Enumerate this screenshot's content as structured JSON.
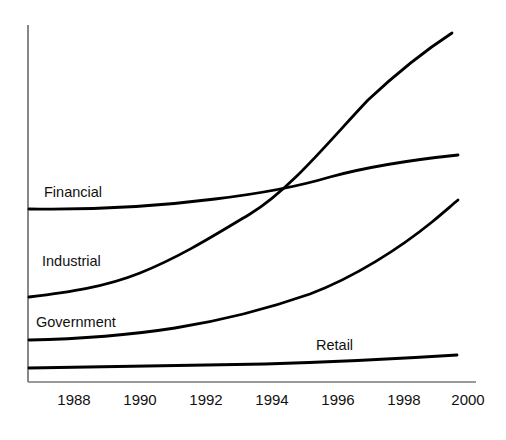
{
  "chart_data": {
    "type": "line",
    "title": "",
    "xlabel": "",
    "ylabel": "",
    "grid": false,
    "legend_position": "inline-labels",
    "axis": {
      "x_ticks": [
        "1988",
        "1990",
        "1992",
        "1994",
        "1996",
        "1998",
        "2000"
      ],
      "x_range": [
        1987,
        2000.5
      ],
      "y_ticks": [],
      "y_range": [
        0,
        100
      ],
      "axis_color": "#555555",
      "line_color": "#000000"
    },
    "x": [
      1987,
      1988,
      1990,
      1992,
      1994,
      1996,
      1998,
      2000
    ],
    "series": [
      {
        "name": "Financial",
        "label": "Financial",
        "values": [
          48,
          48,
          49,
          51,
          54,
          58,
          62,
          66
        ],
        "label_position": {
          "x": 44,
          "y": 185
        },
        "color": "#000000"
      },
      {
        "name": "Industrial",
        "label": "Industrial",
        "values": [
          24,
          25,
          29,
          36,
          45,
          58,
          74,
          94
        ],
        "label_position": {
          "x": 42,
          "y": 254
        },
        "color": "#000000"
      },
      {
        "name": "Government",
        "label": "Government",
        "values": [
          12,
          12,
          14,
          17,
          22,
          29,
          38,
          51
        ],
        "label_position": {
          "x": 36,
          "y": 315
        },
        "color": "#000000"
      },
      {
        "name": "Retail",
        "label": "Retail",
        "values": [
          4,
          4,
          4,
          5,
          5,
          6,
          7,
          9
        ],
        "label_position": {
          "x": 316,
          "y": 338
        },
        "color": "#000000"
      }
    ]
  },
  "series_labels": {
    "financial": "Financial",
    "industrial": "Industrial",
    "government": "Government",
    "retail": "Retail"
  },
  "x_axis": {
    "ticks": [
      {
        "label": "1988",
        "px": 74
      },
      {
        "label": "1990",
        "px": 140
      },
      {
        "label": "1992",
        "px": 206
      },
      {
        "label": "1994",
        "px": 272
      },
      {
        "label": "1996",
        "px": 338
      },
      {
        "label": "1998",
        "px": 404
      },
      {
        "label": "2000",
        "px": 468
      }
    ]
  },
  "colors": {
    "background": "#ffffff",
    "line": "#000000",
    "axis": "#555555",
    "text": "#111111"
  }
}
